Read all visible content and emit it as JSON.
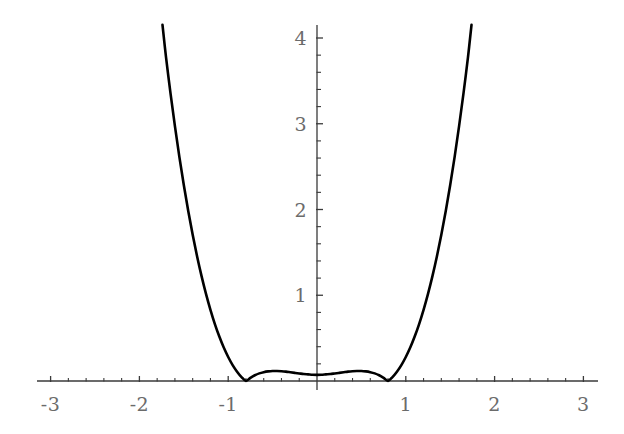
{
  "chart_data": {
    "type": "line",
    "title": "",
    "subtitle": "",
    "xlabel": "",
    "ylabel": "",
    "function": "(x^2 - 1)^2",
    "grid": false,
    "legend": null,
    "xlim": [
      -3.15,
      3.17
    ],
    "ylim": [
      -0.12,
      4.15
    ],
    "x_major_ticks": [
      -3,
      -2,
      -1,
      0,
      1,
      2,
      3
    ],
    "y_major_ticks": [
      1,
      2,
      3,
      4
    ],
    "x_minor_step": 0.2,
    "y_minor_step": 0.2,
    "x_tick_labels": [
      "-3",
      "-2",
      "-1",
      "1",
      "2",
      "3"
    ],
    "x_tick_label_values": [
      -3,
      -2,
      -1,
      1,
      2,
      3
    ],
    "y_tick_labels": [
      "1",
      "2",
      "3",
      "4"
    ],
    "y_tick_label_values": [
      1,
      2,
      3,
      4
    ],
    "key_points": [
      {
        "label": "left minimum",
        "x": -1,
        "y": 0
      },
      {
        "label": "local maximum",
        "x": 0,
        "y": 1
      },
      {
        "label": "right minimum",
        "x": 1,
        "y": 0
      }
    ],
    "x": [
      -1.74,
      -1.7,
      -1.65,
      -1.6,
      -1.55,
      -1.5,
      -1.45,
      -1.4,
      -1.35,
      -1.3,
      -1.25,
      -1.2,
      -1.15,
      -1.1,
      -1.05,
      -1.0,
      -0.95,
      -0.9,
      -0.85,
      -0.8,
      -0.75,
      -0.7,
      -0.65,
      -0.6,
      -0.55,
      -0.5,
      -0.45,
      -0.4,
      -0.35,
      -0.3,
      -0.25,
      -0.2,
      -0.15,
      -0.1,
      -0.05,
      0.0,
      0.05,
      0.1,
      0.15,
      0.2,
      0.25,
      0.3,
      0.35,
      0.4,
      0.45,
      0.5,
      0.55,
      0.6,
      0.65,
      0.7,
      0.75,
      0.8,
      0.85,
      0.9,
      0.95,
      1.0,
      1.05,
      1.1,
      1.15,
      1.2,
      1.25,
      1.3,
      1.35,
      1.4,
      1.45,
      1.5,
      1.55,
      1.6,
      1.65,
      1.7,
      1.74
    ],
    "y": [
      4.153,
      3.775,
      3.358,
      2.972,
      2.614,
      2.285,
      1.982,
      1.705,
      1.452,
      1.223,
      1.016,
      0.83,
      0.664,
      0.518,
      0.39,
      0.28,
      0.186,
      0.109,
      0.046,
      0.0013,
      0.037,
      0.067,
      0.089,
      0.103,
      0.112,
      0.117,
      0.117,
      0.114,
      0.109,
      0.102,
      0.095,
      0.088,
      0.081,
      0.077,
      0.073,
      0.072,
      0.073,
      0.077,
      0.081,
      0.088,
      0.095,
      0.102,
      0.109,
      0.114,
      0.117,
      0.117,
      0.112,
      0.103,
      0.089,
      0.067,
      0.037,
      0.0013,
      0.046,
      0.109,
      0.186,
      0.28,
      0.39,
      0.518,
      0.664,
      0.83,
      1.016,
      1.223,
      1.452,
      1.705,
      1.982,
      2.285,
      2.614,
      2.972,
      3.358,
      3.775,
      4.153
    ],
    "colors": {
      "curve": "#000000",
      "axis": "#3a3a3a",
      "tick_label": "#6b6b6b",
      "background": "#ffffff"
    }
  },
  "axes_geometry": {
    "origin_x_px": 317,
    "origin_y_px": 381,
    "x_scale_px_per_unit": 88.8,
    "y_scale_px_per_unit": 85.75,
    "x_axis_left_px": 37,
    "x_axis_right_px": 598,
    "y_axis_top_px": 25,
    "y_axis_bottom_px": 390
  }
}
